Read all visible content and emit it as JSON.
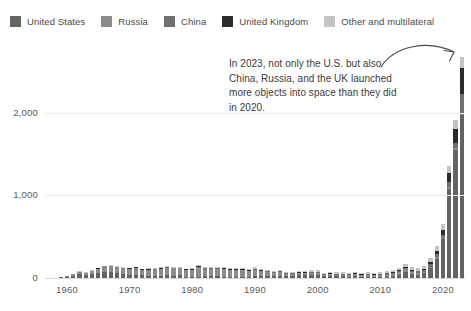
{
  "legend": {
    "items": [
      {
        "label": "United States",
        "color": "#636363",
        "key": "us"
      },
      {
        "label": "Russia",
        "color": "#8c8c8c",
        "key": "russia"
      },
      {
        "label": "China",
        "color": "#707070",
        "key": "china"
      },
      {
        "label": "United Kingdom",
        "color": "#2b2b2b",
        "key": "uk"
      },
      {
        "label": "Other and multilateral",
        "color": "#c4c4c4",
        "key": "other"
      }
    ]
  },
  "annotation": {
    "text": "In 2023, not only the U.S. but also China, Russia, and the UK launched more objects into space than they did in 2020.",
    "arrow_icon": "curved-arrow-icon"
  },
  "chart_data": {
    "type": "bar",
    "stacked": true,
    "title": "",
    "xlabel": "",
    "ylabel": "",
    "ylim": [
      0,
      2700
    ],
    "yticks": [
      0,
      1000,
      2000
    ],
    "ytick_labels": [
      "0",
      "1,000",
      "2,000"
    ],
    "xticks": [
      1960,
      1970,
      1980,
      1990,
      2000,
      2010,
      2020
    ],
    "xtick_labels": [
      "1960",
      "1970",
      "1980",
      "1990",
      "2000",
      "2010",
      "2020"
    ],
    "grid": true,
    "legend_position": "top-left",
    "series_order": [
      "us",
      "russia",
      "china",
      "uk",
      "other"
    ],
    "series": [
      {
        "name": "United States",
        "key": "us",
        "color": "#636363"
      },
      {
        "name": "Russia",
        "key": "russia",
        "color": "#8c8c8c"
      },
      {
        "name": "China",
        "key": "china",
        "color": "#707070"
      },
      {
        "name": "United Kingdom",
        "key": "uk",
        "color": "#2b2b2b"
      },
      {
        "name": "Other and multilateral",
        "key": "other",
        "color": "#c4c4c4"
      }
    ],
    "x": [
      1957,
      1958,
      1959,
      1960,
      1961,
      1962,
      1963,
      1964,
      1965,
      1966,
      1967,
      1968,
      1969,
      1970,
      1971,
      1972,
      1973,
      1974,
      1975,
      1976,
      1977,
      1978,
      1979,
      1980,
      1981,
      1982,
      1983,
      1984,
      1985,
      1986,
      1987,
      1988,
      1989,
      1990,
      1991,
      1992,
      1993,
      1994,
      1995,
      1996,
      1997,
      1998,
      1999,
      2000,
      2001,
      2002,
      2003,
      2004,
      2005,
      2006,
      2007,
      2008,
      2009,
      2010,
      2011,
      2012,
      2013,
      2014,
      2015,
      2016,
      2017,
      2018,
      2019,
      2020,
      2021,
      2022,
      2023
    ],
    "values": {
      "us": [
        0,
        5,
        9,
        16,
        29,
        52,
        38,
        57,
        70,
        79,
        78,
        61,
        58,
        36,
        45,
        33,
        23,
        27,
        28,
        33,
        27,
        34,
        18,
        16,
        18,
        21,
        22,
        22,
        17,
        11,
        9,
        12,
        18,
        31,
        33,
        28,
        24,
        31,
        24,
        30,
        35,
        38,
        45,
        33,
        25,
        24,
        22,
        20,
        16,
        22,
        17,
        19,
        16,
        15,
        19,
        22,
        43,
        72,
        47,
        38,
        62,
        118,
        234,
        475,
        1080,
        1550,
        1970
      ],
      "russia": [
        2,
        1,
        3,
        12,
        20,
        25,
        30,
        38,
        52,
        64,
        72,
        74,
        70,
        81,
        83,
        74,
        86,
        81,
        89,
        99,
        98,
        88,
        87,
        89,
        125,
        101,
        98,
        97,
        98,
        91,
        95,
        90,
        74,
        75,
        59,
        54,
        47,
        48,
        33,
        25,
        29,
        24,
        26,
        34,
        23,
        25,
        21,
        24,
        26,
        25,
        19,
        21,
        22,
        18,
        25,
        24,
        30,
        34,
        26,
        20,
        15,
        17,
        25,
        15,
        24,
        22,
        31
      ],
      "china": [
        0,
        0,
        0,
        0,
        0,
        0,
        0,
        0,
        0,
        0,
        0,
        0,
        0,
        1,
        1,
        0,
        0,
        1,
        3,
        3,
        0,
        0,
        0,
        1,
        1,
        1,
        1,
        3,
        1,
        2,
        2,
        4,
        0,
        5,
        1,
        3,
        1,
        5,
        4,
        3,
        6,
        6,
        4,
        5,
        1,
        4,
        7,
        8,
        5,
        6,
        10,
        11,
        6,
        15,
        19,
        21,
        15,
        16,
        19,
        22,
        18,
        39,
        34,
        35,
        55,
        62,
        230
      ],
      "uk": [
        0,
        0,
        0,
        1,
        0,
        1,
        1,
        0,
        1,
        0,
        1,
        2,
        1,
        2,
        2,
        1,
        1,
        1,
        1,
        2,
        1,
        1,
        1,
        1,
        1,
        1,
        1,
        1,
        1,
        1,
        1,
        2,
        1,
        2,
        1,
        2,
        1,
        2,
        1,
        2,
        2,
        2,
        2,
        2,
        1,
        1,
        1,
        1,
        1,
        1,
        1,
        2,
        1,
        2,
        2,
        3,
        4,
        6,
        5,
        6,
        12,
        16,
        38,
        58,
        112,
        170,
        310
      ],
      "other": [
        0,
        0,
        0,
        1,
        1,
        2,
        2,
        2,
        3,
        4,
        4,
        4,
        5,
        5,
        6,
        6,
        6,
        7,
        9,
        10,
        10,
        11,
        9,
        9,
        10,
        10,
        11,
        12,
        12,
        13,
        13,
        14,
        13,
        15,
        13,
        14,
        12,
        15,
        14,
        16,
        18,
        17,
        18,
        20,
        14,
        16,
        16,
        15,
        14,
        17,
        16,
        18,
        17,
        19,
        22,
        24,
        30,
        36,
        34,
        38,
        44,
        55,
        60,
        68,
        88,
        110,
        130
      ]
    }
  }
}
